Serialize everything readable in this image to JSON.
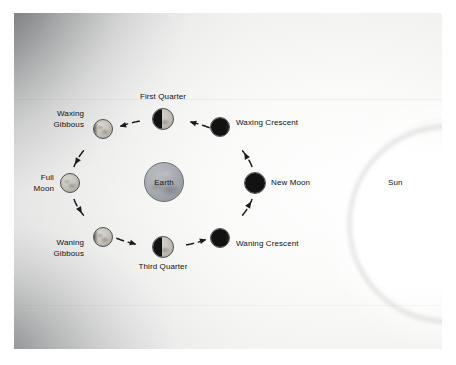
{
  "figure": {
    "kind": "moon-phases-diagram",
    "background_color": "#ececeb",
    "ink_color": "#101010"
  },
  "sun": {
    "label": "Sun",
    "x": 399,
    "y": 183
  },
  "earth": {
    "label": "Earth",
    "x": 164,
    "y": 182,
    "radius": 20,
    "color": "#a9adb2"
  },
  "orbit": {
    "center_x": 163,
    "center_y": 183,
    "radius_x": 92,
    "radius_y": 64,
    "style": "dashed",
    "direction": "counterclockwise",
    "stroke_color": "#1b1b1b"
  },
  "phases": [
    {
      "label": "New Moon",
      "phase": "new",
      "x": 255,
      "y": 183,
      "radius": 11,
      "label_x": 271,
      "label_y": 178,
      "label_align": "right"
    },
    {
      "label": "Waxing Crescent",
      "phase": "crescent",
      "x": 220,
      "y": 127,
      "radius": 10,
      "label_x": 236,
      "label_y": 118,
      "label_align": "right"
    },
    {
      "label": "First Quarter",
      "phase": "quarter",
      "x": 163,
      "y": 119,
      "radius": 11,
      "label_x": 163,
      "label_y": 92,
      "label_align": "center"
    },
    {
      "label": "Waxing\nGibbous",
      "phase": "gibbous",
      "x": 103,
      "y": 129,
      "radius": 10,
      "label_x": 84,
      "label_y": 109,
      "label_align": "left"
    },
    {
      "label": "Full\nMoon",
      "phase": "full",
      "x": 70,
      "y": 183,
      "radius": 10,
      "label_x": 54,
      "label_y": 173,
      "label_align": "left"
    },
    {
      "label": "Waning\nGibbous",
      "phase": "gibbous",
      "x": 103,
      "y": 237,
      "radius": 10,
      "label_x": 84,
      "label_y": 238,
      "label_align": "left"
    },
    {
      "label": "Third Quarter",
      "phase": "quarter",
      "x": 163,
      "y": 247,
      "radius": 11,
      "label_x": 163,
      "label_y": 262,
      "label_align": "center"
    },
    {
      "label": "Waning Crescent",
      "phase": "crescent",
      "x": 220,
      "y": 238,
      "radius": 10,
      "label_x": 236,
      "label_y": 239,
      "label_align": "right"
    }
  ]
}
